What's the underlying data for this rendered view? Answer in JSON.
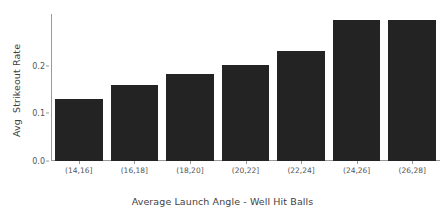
{
  "chart_data": {
    "type": "bar",
    "title": "",
    "xlabel": "Average Launch Angle - Well Hit Balls",
    "ylabel": "Avg  Strikeout Rate",
    "categories": [
      "(14,16]",
      "(16,18]",
      "(18,20]",
      "(20,22]",
      "(22,24]",
      "(24,26]",
      "(26,28]"
    ],
    "values": [
      0.129,
      0.159,
      0.182,
      0.202,
      0.231,
      0.296,
      0.296
    ],
    "ylim": [
      0.0,
      0.308
    ],
    "yticks": [
      0.0,
      0.1,
      0.2
    ],
    "ytick_labels": [
      "0.0",
      "0.1",
      "0.2"
    ],
    "grid": false,
    "legend": null,
    "bar_color": "#232323",
    "axis_color": "#9a9a9a",
    "tick_label_color": "#555555",
    "axis_label_color": "#3f3f3f",
    "background": "#ffffff"
  }
}
